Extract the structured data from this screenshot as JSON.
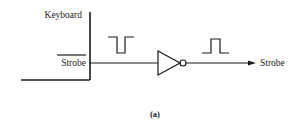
{
  "diagram": {
    "source_block": {
      "label": "Keyboard"
    },
    "input_signal": {
      "label": "Strobe",
      "active_low": true,
      "pulse": "low-going"
    },
    "gate": {
      "type": "inverter"
    },
    "output_signal": {
      "label": "Strobe",
      "active_low": false,
      "pulse": "high-going"
    },
    "caption": "(a)",
    "colors": {
      "ink": "#1a1a1a",
      "background": "#ffffff"
    }
  }
}
